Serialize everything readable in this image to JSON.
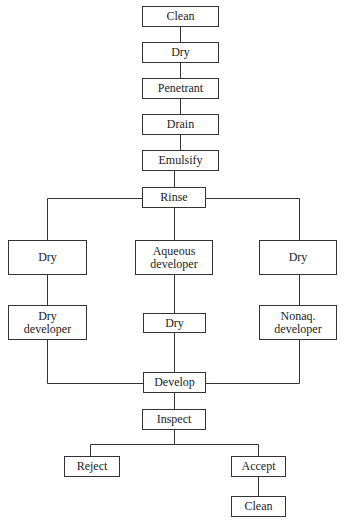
{
  "diagram": {
    "type": "flowchart",
    "title": "",
    "nodes": [
      {
        "id": "clean1",
        "label": "Clean",
        "x": 142,
        "y": 6,
        "w": 77,
        "h": 21
      },
      {
        "id": "dry1",
        "label": "Dry",
        "x": 142,
        "y": 42,
        "w": 77,
        "h": 21
      },
      {
        "id": "penetrant",
        "label": "Penetrant",
        "x": 142,
        "y": 78,
        "w": 77,
        "h": 21
      },
      {
        "id": "drain",
        "label": "Drain",
        "x": 142,
        "y": 114,
        "w": 77,
        "h": 21
      },
      {
        "id": "emulsify",
        "label": "Emulsify",
        "x": 142,
        "y": 150,
        "w": 77,
        "h": 21
      },
      {
        "id": "rinse",
        "label": "Rinse",
        "x": 142,
        "y": 187,
        "w": 64,
        "h": 21
      },
      {
        "id": "dry_left",
        "label": "Dry",
        "x": 8,
        "y": 240,
        "w": 79,
        "h": 35
      },
      {
        "id": "aqueous_dev",
        "label": "Aqueous developer",
        "x": 135,
        "y": 240,
        "w": 78,
        "h": 35
      },
      {
        "id": "dry_right",
        "label": "Dry",
        "x": 259,
        "y": 240,
        "w": 78,
        "h": 35
      },
      {
        "id": "dry_dev",
        "label": "Dry developer",
        "x": 8,
        "y": 305,
        "w": 79,
        "h": 35
      },
      {
        "id": "dry_center",
        "label": "Dry",
        "x": 143,
        "y": 313,
        "w": 63,
        "h": 20
      },
      {
        "id": "nonaq_dev",
        "label": "Nonaq. developer",
        "x": 259,
        "y": 305,
        "w": 78,
        "h": 35
      },
      {
        "id": "develop",
        "label": "Develop",
        "x": 143,
        "y": 372,
        "w": 63,
        "h": 21
      },
      {
        "id": "inspect",
        "label": "Inspect",
        "x": 142,
        "y": 409,
        "w": 64,
        "h": 21
      },
      {
        "id": "reject",
        "label": "Reject",
        "x": 64,
        "y": 456,
        "w": 56,
        "h": 21
      },
      {
        "id": "accept",
        "label": "Accept",
        "x": 231,
        "y": 456,
        "w": 55,
        "h": 21
      },
      {
        "id": "clean2",
        "label": "Clean",
        "x": 231,
        "y": 496,
        "w": 55,
        "h": 21
      }
    ],
    "edges": [
      [
        "clean1",
        "dry1"
      ],
      [
        "dry1",
        "penetrant"
      ],
      [
        "penetrant",
        "drain"
      ],
      [
        "drain",
        "emulsify"
      ],
      [
        "emulsify",
        "rinse"
      ],
      [
        "rinse",
        "dry_left"
      ],
      [
        "rinse",
        "aqueous_dev"
      ],
      [
        "rinse",
        "dry_right"
      ],
      [
        "dry_left",
        "dry_dev"
      ],
      [
        "aqueous_dev",
        "dry_center"
      ],
      [
        "dry_right",
        "nonaq_dev"
      ],
      [
        "dry_dev",
        "develop"
      ],
      [
        "dry_center",
        "develop"
      ],
      [
        "nonaq_dev",
        "develop"
      ],
      [
        "develop",
        "inspect"
      ],
      [
        "inspect",
        "reject"
      ],
      [
        "inspect",
        "accept"
      ],
      [
        "accept",
        "clean2"
      ]
    ],
    "line_color": "#333333"
  },
  "labels": {
    "clean1": "Clean",
    "dry1": "Dry",
    "penetrant": "Penetrant",
    "drain": "Drain",
    "emulsify": "Emulsify",
    "rinse": "Rinse",
    "dry_left": "Dry",
    "aqueous_dev_l1": "Aqueous",
    "aqueous_dev_l2": "developer",
    "dry_right": "Dry",
    "dry_dev_l1": "Dry",
    "dry_dev_l2": "developer",
    "dry_center": "Dry",
    "nonaq_dev_l1": "Nonaq.",
    "nonaq_dev_l2": "developer",
    "develop": "Develop",
    "inspect": "Inspect",
    "reject": "Reject",
    "accept": "Accept",
    "clean2": "Clean"
  }
}
